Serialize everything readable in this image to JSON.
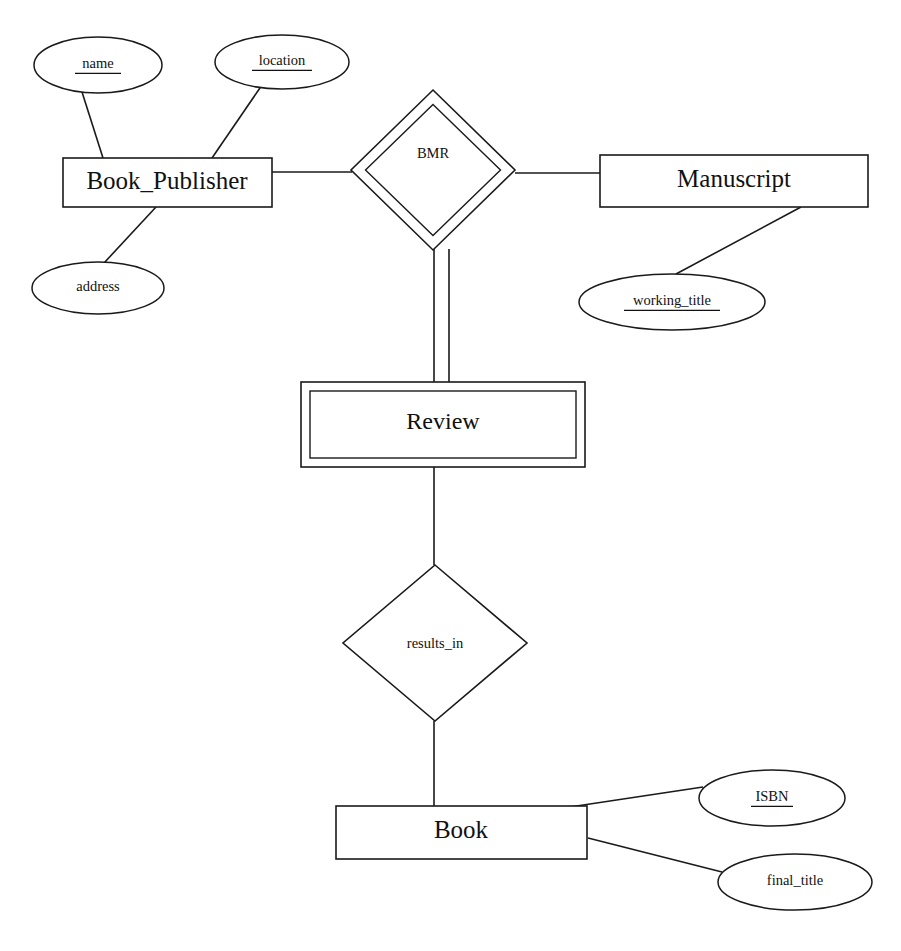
{
  "diagram": {
    "type": "entity-relationship-diagram",
    "notation": "Chen",
    "canvas": {
      "width": 901,
      "height": 951
    },
    "colors": {
      "stroke": "#1a1a1a",
      "fill": "#ffffff",
      "text": "#111111"
    }
  },
  "entities": [
    {
      "id": "book_publisher",
      "label": "Book_Publisher",
      "kind": "strong-entity",
      "shape": "rectangle",
      "box": {
        "x": 63,
        "y": 158,
        "w": 209,
        "h": 49
      },
      "text": {
        "x": 167,
        "y": 183,
        "size": 25
      }
    },
    {
      "id": "manuscript",
      "label": "Manuscript",
      "kind": "strong-entity",
      "shape": "rectangle",
      "box": {
        "x": 600,
        "y": 155,
        "w": 268,
        "h": 52
      },
      "text": {
        "x": 734,
        "y": 181,
        "size": 25
      }
    },
    {
      "id": "review",
      "label": "Review",
      "kind": "weak-entity",
      "shape": "double-rectangle",
      "box": {
        "x": 301,
        "y": 382,
        "w": 284,
        "h": 85
      },
      "inner_inset": 9,
      "text": {
        "x": 443,
        "y": 423,
        "size": 24
      }
    },
    {
      "id": "book",
      "label": "Book",
      "kind": "strong-entity",
      "shape": "rectangle",
      "box": {
        "x": 336,
        "y": 806,
        "w": 251,
        "h": 53
      },
      "text": {
        "x": 461,
        "y": 832,
        "size": 25
      }
    }
  ],
  "relationships": [
    {
      "id": "bmr",
      "label": "BMR",
      "kind": "identifying-relationship",
      "shape": "double-diamond",
      "center": {
        "x": 433,
        "y": 170
      },
      "rx": 82,
      "ry": 80,
      "inner_inset": 10,
      "text": {
        "x": 433,
        "y": 155,
        "size": 15
      }
    },
    {
      "id": "results_in",
      "label": "results_in",
      "kind": "relationship",
      "shape": "diamond",
      "center": {
        "x": 435,
        "y": 643
      },
      "rx": 92,
      "ry": 78,
      "text": {
        "x": 435,
        "y": 645,
        "size": 14.5
      }
    }
  ],
  "attributes": [
    {
      "id": "name",
      "label": "name",
      "owner": "book_publisher",
      "key": true,
      "center": {
        "x": 98,
        "y": 65
      },
      "rx": 64,
      "ry": 28,
      "text_size": 14.5,
      "underline_w": 46
    },
    {
      "id": "location",
      "label": "location",
      "owner": "book_publisher",
      "key": true,
      "center": {
        "x": 282,
        "y": 62
      },
      "rx": 67,
      "ry": 27,
      "text_size": 14.5,
      "underline_w": 60
    },
    {
      "id": "address",
      "label": "address",
      "owner": "book_publisher",
      "key": false,
      "center": {
        "x": 98,
        "y": 288
      },
      "rx": 66,
      "ry": 26,
      "text_size": 14.5,
      "underline_w": 0
    },
    {
      "id": "working_title",
      "label": "working_title",
      "owner": "manuscript",
      "key": true,
      "center": {
        "x": 672,
        "y": 302
      },
      "rx": 93,
      "ry": 28,
      "text_size": 14.5,
      "underline_w": 96
    },
    {
      "id": "isbn",
      "label": "ISBN",
      "owner": "book",
      "key": true,
      "center": {
        "x": 772,
        "y": 798
      },
      "rx": 73,
      "ry": 28,
      "text_size": 14.5,
      "underline_w": 42
    },
    {
      "id": "final_title",
      "label": "final_title",
      "owner": "book",
      "key": false,
      "center": {
        "x": 795,
        "y": 882
      },
      "rx": 77,
      "ry": 28,
      "text_size": 14.5,
      "underline_w": 0
    }
  ],
  "connectors": [
    {
      "id": "name-to-publisher",
      "from": "name",
      "to": "book_publisher",
      "style": "single",
      "path": "M 82,92 L 103,158"
    },
    {
      "id": "location-to-publisher",
      "from": "location",
      "to": "book_publisher",
      "style": "single",
      "path": "M 262,85 L 212,158"
    },
    {
      "id": "publisher-to-address",
      "from": "book_publisher",
      "to": "address",
      "style": "single",
      "path": "M 156,207 L 104,263"
    },
    {
      "id": "publisher-to-bmr",
      "from": "book_publisher",
      "to": "bmr",
      "style": "single",
      "path": "M 272,172 L 352,172"
    },
    {
      "id": "bmr-to-manuscript",
      "from": "bmr",
      "to": "manuscript",
      "style": "single",
      "path": "M 515,173 L 600,173"
    },
    {
      "id": "manuscript-to-working-title",
      "from": "manuscript",
      "to": "working_title",
      "style": "single",
      "path": "M 801,207 L 676,274"
    },
    {
      "id": "bmr-to-review",
      "from": "bmr",
      "to": "review",
      "style": "double",
      "path_a": "M 434,249 L 434,382",
      "path_b": "M 449,249 L 449,382"
    },
    {
      "id": "review-to-results-in",
      "from": "review",
      "to": "results_in",
      "style": "single",
      "path": "M 434,467 L 434,565"
    },
    {
      "id": "results-in-to-book",
      "from": "results_in",
      "to": "book",
      "style": "single",
      "path": "M 434,721 L 434,806"
    },
    {
      "id": "book-to-isbn",
      "from": "book",
      "to": "isbn",
      "style": "single",
      "path": "M 570,807 L 703,787"
    },
    {
      "id": "book-to-final-title",
      "from": "book",
      "to": "final_title",
      "style": "single",
      "path": "M 588,838 L 722,872"
    }
  ]
}
